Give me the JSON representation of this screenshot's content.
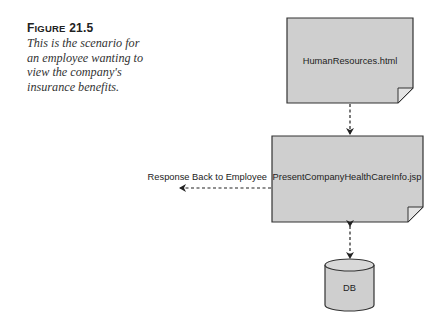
{
  "caption": {
    "figure_label_first": "F",
    "figure_label_rest": "IGURE",
    "figure_number": "21.5",
    "text": "This is the scenario for an employee wanting to view the company's insurance benefits."
  },
  "diagram": {
    "nodes": [
      {
        "id": "html_page",
        "label": "HumanResources.html",
        "shape": "document"
      },
      {
        "id": "jsp_page",
        "label": "PresentCompanyHealthCareInfo.jsp",
        "shape": "document"
      },
      {
        "id": "db",
        "label": "DB",
        "shape": "cylinder"
      }
    ],
    "edges": [
      {
        "from": "html_page",
        "to": "jsp_page",
        "style": "dashed",
        "direction": "forward"
      },
      {
        "from": "jsp_page",
        "to": "employee",
        "style": "dashed",
        "direction": "forward",
        "label": "Response Back to Employee"
      },
      {
        "from": "jsp_page",
        "to": "db",
        "style": "dashed",
        "direction": "both"
      }
    ],
    "colors": {
      "box_fill": "#cfcfcf",
      "stroke": "#333333",
      "fold_fill": "#e4e4e4"
    }
  }
}
